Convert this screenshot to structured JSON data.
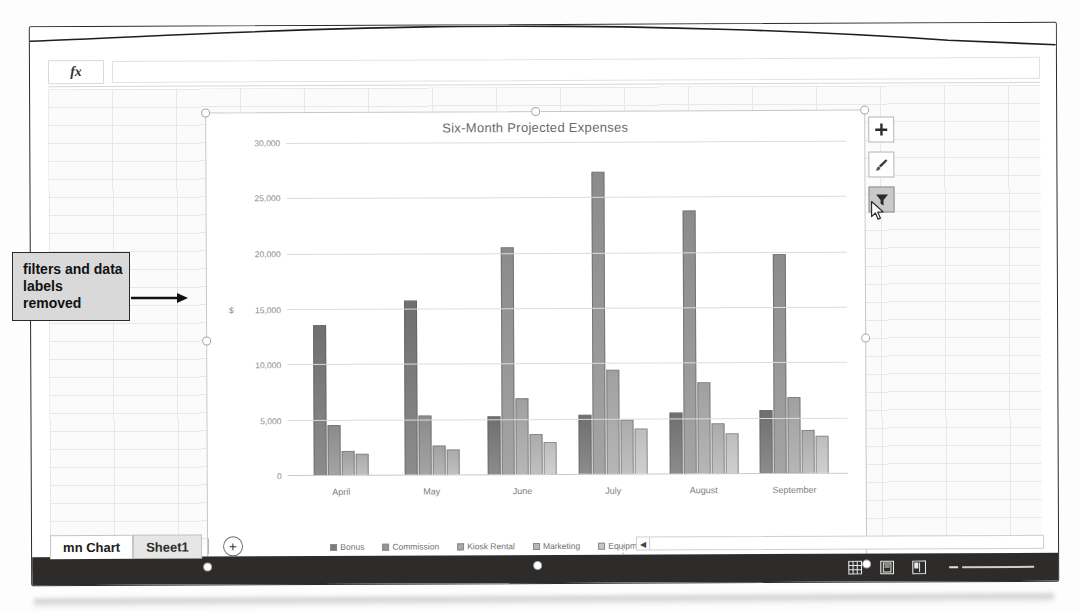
{
  "window": {
    "ribbon_fragment_label": "Location",
    "ribbon_fragment_label2": "ype"
  },
  "formula_bar": {
    "fx_label": "fx",
    "value": "",
    "placeholder": ""
  },
  "annotation": {
    "callout_text": "filters and data labels removed"
  },
  "chart_buttons": [
    {
      "name": "chart-elements-button",
      "icon": "plus-icon",
      "label": "Chart Elements",
      "active": false
    },
    {
      "name": "chart-styles-button",
      "icon": "brush-icon",
      "label": "Chart Styles",
      "active": false
    },
    {
      "name": "chart-filters-button",
      "icon": "funnel-icon",
      "label": "Chart Filters",
      "active": true
    }
  ],
  "sheet_tabs": {
    "tabs": [
      {
        "label": "mn Chart",
        "active": true
      },
      {
        "label": "Sheet1",
        "active": false
      }
    ],
    "add_sheet_label": "+"
  },
  "status_bar": {
    "views": [
      {
        "name": "normal-view-button",
        "icon": "grid-icon"
      },
      {
        "name": "page-layout-view-button",
        "icon": "page-icon"
      },
      {
        "name": "page-break-view-button",
        "icon": "page-break-icon"
      }
    ],
    "zoom_minus_label": "−"
  },
  "ghost_cells": [
    {
      "text": "",
      "x": 470,
      "y": 108
    },
    {
      "text": "",
      "x": 700,
      "y": 112
    }
  ],
  "chart_data": {
    "type": "bar",
    "title": "Six-Month Projected Expenses",
    "xlabel": "",
    "ylabel": "",
    "currency_marker": "$",
    "currency_marker_at": 15000,
    "categories": [
      "April",
      "May",
      "June",
      "July",
      "August",
      "September"
    ],
    "series": [
      {
        "name": "Bonus",
        "values": [
          13600,
          15700,
          5200,
          5300,
          5500,
          5700
        ]
      },
      {
        "name": "Commission",
        "values": [
          4500,
          5300,
          20500,
          27300,
          23800,
          19800
        ]
      },
      {
        "name": "Kiosk Rental",
        "values": [
          2200,
          2600,
          6900,
          9400,
          8200,
          6900
        ]
      },
      {
        "name": "Marketing",
        "values": [
          1900,
          2300,
          3600,
          4900,
          4500,
          3900
        ]
      },
      {
        "name": "Equipment Repair and Maintenance",
        "values": [
          null,
          null,
          2900,
          4100,
          3600,
          3300
        ]
      }
    ],
    "ylim": [
      0,
      30000
    ],
    "yticks": [
      0,
      5000,
      10000,
      15000,
      20000,
      25000,
      30000
    ],
    "ytick_labels": [
      "0",
      "5,000",
      "10,000",
      "15,000",
      "20,000",
      "25,000",
      "30,000"
    ],
    "grid": true,
    "legend_position": "bottom"
  },
  "colors": {
    "series": [
      "#7c7c7c",
      "#949494",
      "#a8a8a8",
      "#b6b6b6",
      "#c6c6c6"
    ],
    "status_bar": "#2e2c2b",
    "callout_bg": "#d9d9d9",
    "gridline": "#dcdcdc"
  }
}
